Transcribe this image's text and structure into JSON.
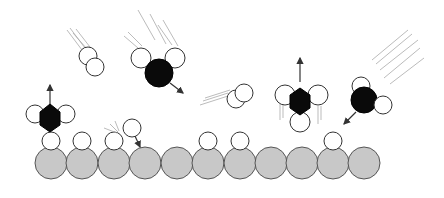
{
  "diagram": {
    "title": "",
    "colors": {
      "surface_atom": "#c8c8c8",
      "hydrogen_atom": "#ffffff",
      "carbon_atom": "#0a0a0a",
      "motion_trail": "#aaaaaa",
      "arrow": "#333333"
    },
    "surface": {
      "atom_count": 11,
      "adsorbed_h_positions": [
        0,
        1,
        2,
        5,
        6,
        9
      ]
    },
    "species": [
      {
        "id": "h2-falling-left",
        "type": "H2",
        "motion": "incoming"
      },
      {
        "id": "ch2-falling-top",
        "type": "CH2",
        "motion": "incoming"
      },
      {
        "id": "h2-flying-mid",
        "type": "H2",
        "motion": "incoming"
      },
      {
        "id": "ch3-leaving-right",
        "type": "CH3",
        "motion": "desorbing"
      },
      {
        "id": "ch2-falling-right",
        "type": "CH2",
        "motion": "incoming"
      },
      {
        "id": "ch3-leaving-left",
        "type": "CH3 on surface H",
        "motion": "desorbing"
      },
      {
        "id": "h-abstraction",
        "type": "H",
        "motion": "incoming to surface"
      }
    ]
  }
}
